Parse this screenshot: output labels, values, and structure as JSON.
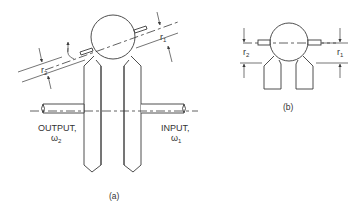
{
  "figure": {
    "part_a": {
      "caption": "(a)",
      "output_label": "OUTPUT,",
      "output_omega": "ω",
      "output_omega_sub": "2",
      "input_label": "INPUT,",
      "input_omega": "ω",
      "input_omega_sub": "1",
      "r1_label": "r",
      "r1_sub": "1",
      "r2_label": "r",
      "r2_sub": "2"
    },
    "part_b": {
      "caption": "(b)",
      "r1_label": "r",
      "r1_sub": "1",
      "r2_label": "r",
      "r2_sub": "2"
    },
    "colors": {
      "line": "#3a3a3a",
      "background": "#ffffff"
    }
  }
}
